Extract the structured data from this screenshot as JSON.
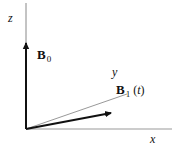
{
  "diagram": {
    "title": "",
    "axes": {
      "z": {
        "label": "z"
      },
      "x": {
        "label": "x"
      },
      "y": {
        "label": "y"
      }
    },
    "vectors": [
      {
        "name": "B0",
        "symbol": "B",
        "subscript": "0",
        "argument": ""
      },
      {
        "name": "B1(t)",
        "symbol": "B",
        "subscript": "1",
        "argument": "t"
      }
    ],
    "colors": {
      "axis": "#999999",
      "vector": "#111111",
      "background": "#ffffff"
    }
  }
}
